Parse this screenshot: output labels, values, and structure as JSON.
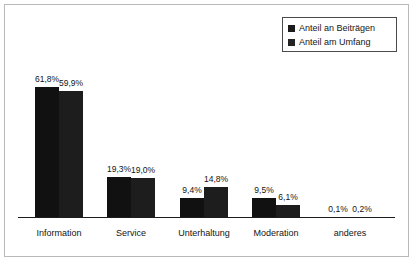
{
  "chart_data": {
    "type": "bar",
    "title": "",
    "subtitle": "",
    "xlabel": "",
    "ylabel": "",
    "grid": false,
    "legend_position": "top-right",
    "ylim": [
      0,
      65
    ],
    "categories": [
      "Information",
      "Service",
      "Unterhaltung",
      "Moderation",
      "anderes"
    ],
    "series": [
      {
        "name": "Anteil an Beiträgen",
        "color": "#111111",
        "values": [
          61.8,
          19.3,
          9.4,
          9.5,
          0.1
        ],
        "labels": [
          "61,8%",
          "19,3%",
          "9,4%",
          "9,5%",
          "0,1%"
        ]
      },
      {
        "name": "Anteil am Umfang",
        "color": "#1d1d1d",
        "values": [
          59.9,
          19.0,
          14.8,
          6.1,
          0.2
        ],
        "labels": [
          "59,9%",
          "19,0%",
          "14,8%",
          "6,1%",
          "0,2%"
        ]
      }
    ]
  },
  "legend": {
    "items": [
      {
        "label": "Anteil an Beiträgen"
      },
      {
        "label": "Anteil am Umfang"
      }
    ]
  },
  "axis": {
    "categories": [
      "Information",
      "Service",
      "Unterhaltung",
      "Moderation",
      "anderes"
    ]
  }
}
